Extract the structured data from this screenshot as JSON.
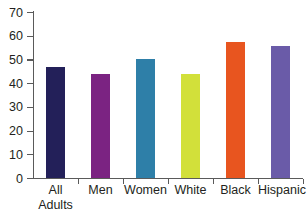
{
  "chart_data": {
    "type": "bar",
    "title": "",
    "xlabel": "",
    "ylabel": "",
    "ylim": [
      0,
      70
    ],
    "yticks": [
      0,
      10,
      20,
      30,
      40,
      50,
      60,
      70
    ],
    "grid": false,
    "legend": "none",
    "categories": [
      "All\nAdults",
      "Men",
      "Women",
      "White",
      "Black",
      "Hispanic"
    ],
    "values": [
      47,
      44,
      50,
      44,
      57.5,
      55.5
    ],
    "colors": [
      "#232059",
      "#7b2382",
      "#2e7fa8",
      "#d2e03a",
      "#e8551f",
      "#6a5ba8"
    ],
    "axis_color": "#5a5a5a",
    "background": "#ffffff"
  }
}
